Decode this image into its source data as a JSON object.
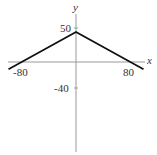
{
  "chart_data": {
    "type": "line",
    "title": "",
    "xlabel": "x",
    "ylabel": "y",
    "xlim": [
      -100,
      100
    ],
    "ylim": [
      -120,
      80
    ],
    "grid": false,
    "legend": null,
    "x_ticks": [
      -80,
      80
    ],
    "y_ticks": [
      50,
      -40
    ],
    "series": [
      {
        "name": "y = 45 - 0.5625|x|",
        "x": [
          -100,
          0,
          100
        ],
        "y": [
          -11,
          45,
          -11
        ]
      }
    ],
    "annotations": []
  },
  "labels": {
    "x_axis": "x",
    "y_axis": "y",
    "tick_x_neg": "-80",
    "tick_x_pos": "80",
    "tick_y_pos": "50",
    "tick_y_neg": "-40"
  },
  "colors": {
    "curve": "#111111",
    "axes": "#999999",
    "text": "#333333"
  }
}
